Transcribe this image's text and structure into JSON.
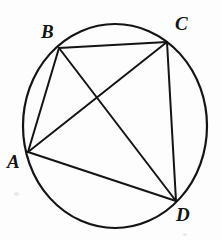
{
  "figure": {
    "name": "cyclic-quadrilateral-abcd",
    "background_color": "#fdfdfd",
    "stroke_color": "#141414",
    "label_color": "#141414"
  },
  "circle": {
    "name": "circumcircle",
    "center_x": 115,
    "center_y": 126,
    "radius": 92,
    "stroke_width": 2.2
  },
  "points": [
    {
      "id": "A",
      "label": "A",
      "x": 28,
      "y": 152,
      "label_x": 7,
      "label_y": 152
    },
    {
      "id": "B",
      "label": "B",
      "x": 59,
      "y": 48,
      "label_x": 41,
      "label_y": 22
    },
    {
      "id": "C",
      "label": "C",
      "x": 167,
      "y": 42,
      "label_x": 175,
      "label_y": 14
    },
    {
      "id": "D",
      "label": "D",
      "x": 176,
      "y": 201,
      "label_x": 176,
      "label_y": 205
    }
  ],
  "chords": [
    {
      "id": "BC",
      "from": "B",
      "to": "C",
      "kind": "side",
      "x1": 59,
      "y1": 48,
      "x2": 167,
      "y2": 42
    },
    {
      "id": "AB",
      "from": "A",
      "to": "B",
      "kind": "side",
      "x1": 28,
      "y1": 152,
      "x2": 59,
      "y2": 48
    },
    {
      "id": "CD",
      "from": "C",
      "to": "D",
      "kind": "side",
      "x1": 167,
      "y1": 42,
      "x2": 176,
      "y2": 201
    },
    {
      "id": "AD",
      "from": "A",
      "to": "D",
      "kind": "side",
      "x1": 28,
      "y1": 152,
      "x2": 176,
      "y2": 201
    },
    {
      "id": "AC",
      "from": "A",
      "to": "C",
      "kind": "diagonal",
      "x1": 28,
      "y1": 152,
      "x2": 167,
      "y2": 42
    },
    {
      "id": "BD",
      "from": "B",
      "to": "D",
      "kind": "diagonal",
      "x1": 59,
      "y1": 48,
      "x2": 176,
      "y2": 201
    }
  ],
  "intersection": {
    "name": "diagonal-crossing",
    "x": 101,
    "y": 98
  },
  "chord_stroke_width": 2.0
}
